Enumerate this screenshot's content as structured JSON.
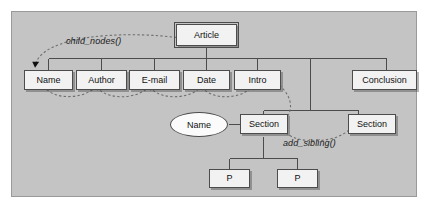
{
  "figure": {
    "panel_background": "#c4c4c4",
    "node_fill": "#f2f2f2",
    "line_color": "#4c4c4c",
    "dashed_color": "#6b6b6b"
  },
  "nodes": {
    "root": {
      "label": "Article"
    },
    "children": [
      {
        "label": "Name"
      },
      {
        "label": "Author"
      },
      {
        "label": "E-mail"
      },
      {
        "label": "Date"
      },
      {
        "label": "Intro"
      },
      {
        "label": "Conclusion"
      }
    ],
    "section_name": {
      "label": "Name"
    },
    "section_first": {
      "label": "Section"
    },
    "section_second": {
      "label": "Section"
    },
    "paragraphs": [
      {
        "label": "P"
      },
      {
        "label": "P"
      }
    ]
  },
  "annotations": {
    "child_nodes": "child_nodes()",
    "add_sibling": "add_sibling()"
  }
}
